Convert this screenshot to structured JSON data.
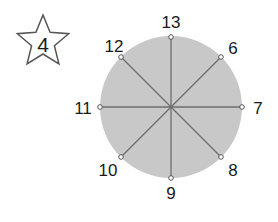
{
  "badge": {
    "shape": "star",
    "number": "4",
    "center": [
      43,
      42
    ],
    "outer_radius": 27,
    "inner_radius": 12,
    "stroke": "#555555",
    "fill": "#ffffff"
  },
  "circle": {
    "center": [
      171,
      107
    ],
    "radius": 71,
    "fill": "#c8c8c8",
    "line_color": "#6e6e6e",
    "point_fill": "#ffffff",
    "point_stroke": "#555555"
  },
  "points": [
    {
      "label": "13",
      "x": 171,
      "y": 37,
      "lx": 171,
      "ly": 22
    },
    {
      "label": "6",
      "x": 221,
      "y": 57,
      "lx": 233,
      "ly": 48
    },
    {
      "label": "7",
      "x": 242,
      "y": 107,
      "lx": 258,
      "ly": 108
    },
    {
      "label": "8",
      "x": 221,
      "y": 157,
      "lx": 233,
      "ly": 170
    },
    {
      "label": "9",
      "x": 171,
      "y": 178,
      "lx": 171,
      "ly": 193
    },
    {
      "label": "10",
      "x": 121,
      "y": 157,
      "lx": 108,
      "ly": 170
    },
    {
      "label": "11",
      "x": 100,
      "y": 107,
      "lx": 83,
      "ly": 108
    },
    {
      "label": "12",
      "x": 121,
      "y": 57,
      "lx": 114,
      "ly": 46
    }
  ]
}
